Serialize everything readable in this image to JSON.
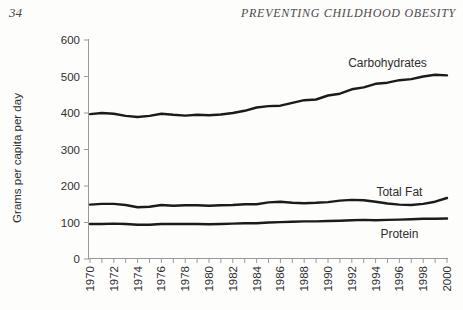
{
  "page": {
    "number": "34",
    "running_header": "PREVENTING CHILDHOOD OBESITY"
  },
  "chart_data": {
    "type": "line",
    "title": "",
    "xlabel": "",
    "ylabel": "Grams per capita per day",
    "ylim": [
      0,
      600
    ],
    "yticks": [
      0,
      100,
      200,
      300,
      400,
      500,
      600
    ],
    "grid": false,
    "legend_position": "inline-labels",
    "line_color": "#1b1b1b",
    "axis_color": "#9a9a9a",
    "label_color": "#2e2e2e",
    "x": [
      1970,
      1971,
      1972,
      1973,
      1974,
      1975,
      1976,
      1977,
      1978,
      1979,
      1980,
      1981,
      1982,
      1983,
      1984,
      1985,
      1986,
      1987,
      1988,
      1989,
      1990,
      1991,
      1992,
      1993,
      1994,
      1995,
      1996,
      1997,
      1998,
      1999,
      2000
    ],
    "xtick_labels": [
      "1970",
      "1972",
      "1974",
      "1976",
      "1978",
      "1980",
      "1982",
      "1984",
      "1986",
      "1988",
      "1990",
      "1992",
      "1994",
      "1996",
      "1998",
      "2000"
    ],
    "series": [
      {
        "name": "Carbohydrates",
        "values": [
          397,
          400,
          398,
          392,
          389,
          392,
          398,
          395,
          393,
          395,
          394,
          396,
          400,
          406,
          415,
          419,
          420,
          428,
          435,
          437,
          448,
          453,
          465,
          470,
          480,
          483,
          490,
          493,
          500,
          505,
          503
        ],
        "label_year": 1995,
        "label_value": 537
      },
      {
        "name": "Total Fat",
        "values": [
          149,
          151,
          151,
          148,
          142,
          143,
          148,
          146,
          147,
          147,
          146,
          147,
          148,
          150,
          150,
          155,
          157,
          154,
          153,
          154,
          156,
          160,
          162,
          161,
          157,
          152,
          149,
          148,
          151,
          157,
          167
        ],
        "label_year": 1996,
        "label_value": 184
      },
      {
        "name": "Protein",
        "values": [
          96,
          96,
          97,
          96,
          94,
          94,
          96,
          96,
          96,
          96,
          95,
          96,
          97,
          98,
          98,
          100,
          101,
          102,
          103,
          103,
          104,
          105,
          106,
          107,
          106,
          107,
          108,
          109,
          110,
          110,
          111
        ],
        "label_year": 1996,
        "label_value": 68
      }
    ]
  }
}
